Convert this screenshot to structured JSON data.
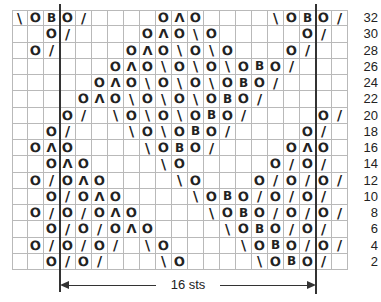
{
  "chart": {
    "columns": 21,
    "row_labels": [
      "32",
      "30",
      "28",
      "26",
      "24",
      "22",
      "20",
      "18",
      "16",
      "14",
      "12",
      "10",
      "8",
      "6",
      "4",
      "2"
    ],
    "symbols": {
      "\\": "ssk",
      "O": "yarn-over",
      "B": "knit-through-back-loop",
      "/": "k2tog",
      "Λ": "central-double-decrease"
    },
    "rows": [
      {
        "label": "32",
        "cells": {
          "0": "\\",
          "1": "O",
          "2": "B",
          "3": "O",
          "4": "/",
          "9": "O",
          "10": "Λ",
          "11": "O",
          "16": "\\",
          "17": "O",
          "18": "B",
          "19": "O",
          "20": "/"
        }
      },
      {
        "label": "30",
        "cells": {
          "2": "O",
          "3": "/",
          "8": "O",
          "9": "Λ",
          "10": "O",
          "11": "\\",
          "12": "O",
          "18": "O",
          "19": "/"
        }
      },
      {
        "label": "28",
        "cells": {
          "1": "O",
          "2": "/",
          "7": "O",
          "8": "Λ",
          "9": "O",
          "10": "\\",
          "11": "O",
          "12": "\\",
          "13": "O",
          "17": "O",
          "18": "/"
        }
      },
      {
        "label": "26",
        "cells": {
          "6": "O",
          "7": "Λ",
          "8": "O",
          "9": "\\",
          "10": "O",
          "11": "\\",
          "12": "O",
          "13": "\\",
          "14": "O",
          "15": "B",
          "16": "O",
          "17": "/"
        }
      },
      {
        "label": "24",
        "cells": {
          "5": "O",
          "6": "Λ",
          "7": "O",
          "8": "\\",
          "9": "O",
          "10": "\\",
          "11": "O",
          "12": "\\",
          "13": "O",
          "14": "B",
          "15": "O",
          "16": "/"
        }
      },
      {
        "label": "22",
        "cells": {
          "4": "O",
          "5": "Λ",
          "6": "O",
          "7": "\\",
          "8": "O",
          "9": "\\",
          "10": "O",
          "11": "\\",
          "12": "O",
          "13": "B",
          "14": "O",
          "15": "/"
        }
      },
      {
        "label": "20",
        "cells": {
          "3": "O",
          "4": "/",
          "6": "\\",
          "7": "O",
          "8": "\\",
          "9": "O",
          "10": "\\",
          "11": "O",
          "12": "B",
          "13": "O",
          "14": "/",
          "19": "O",
          "20": "/"
        }
      },
      {
        "label": "18",
        "cells": {
          "2": "O",
          "3": "/",
          "7": "\\",
          "8": "O",
          "9": "\\",
          "10": "O",
          "11": "B",
          "12": "O",
          "13": "/",
          "18": "O",
          "19": "/"
        }
      },
      {
        "label": "16",
        "cells": {
          "1": "O",
          "2": "Λ",
          "3": "O",
          "8": "\\",
          "9": "O",
          "10": "B",
          "11": "O",
          "12": "/",
          "17": "O",
          "18": "Λ",
          "19": "O"
        }
      },
      {
        "label": "14",
        "cells": {
          "2": "O",
          "3": "Λ",
          "4": "O",
          "9": "\\",
          "10": "O",
          "16": "O",
          "17": "/",
          "18": "O",
          "19": "/"
        }
      },
      {
        "label": "12",
        "cells": {
          "1": "O",
          "2": "/",
          "3": "O",
          "4": "Λ",
          "5": "O",
          "10": "\\",
          "11": "O",
          "15": "O",
          "16": "/",
          "17": "O",
          "18": "/",
          "19": "O",
          "20": "/"
        }
      },
      {
        "label": "10",
        "cells": {
          "2": "O",
          "3": "/",
          "4": "O",
          "5": "Λ",
          "6": "O",
          "11": "\\",
          "12": "O",
          "13": "B",
          "14": "O",
          "15": "/",
          "16": "O",
          "17": "/",
          "18": "O",
          "19": "/"
        }
      },
      {
        "label": "8",
        "cells": {
          "1": "O",
          "2": "/",
          "3": "O",
          "4": "/",
          "5": "O",
          "6": "Λ",
          "7": "O",
          "12": "\\",
          "13": "O",
          "14": "B",
          "15": "O",
          "16": "/",
          "17": "O",
          "18": "/",
          "19": "O",
          "20": "/"
        }
      },
      {
        "label": "6",
        "cells": {
          "2": "O",
          "3": "/",
          "4": "O",
          "5": "/",
          "6": "O",
          "7": "Λ",
          "8": "O",
          "13": "\\",
          "14": "O",
          "15": "B",
          "16": "O",
          "17": "/",
          "18": "O",
          "19": "/"
        }
      },
      {
        "label": "4",
        "cells": {
          "1": "O",
          "2": "/",
          "3": "O",
          "4": "/",
          "5": "O",
          "6": "/",
          "8": "\\",
          "9": "O",
          "14": "\\",
          "15": "O",
          "16": "B",
          "17": "O",
          "18": "/",
          "19": "O",
          "20": "/"
        }
      },
      {
        "label": "2",
        "cells": {
          "2": "O",
          "3": "/",
          "4": "O",
          "5": "/",
          "9": "\\",
          "10": "O",
          "15": "\\",
          "16": "O",
          "17": "B",
          "18": "O",
          "19": "/"
        }
      }
    ],
    "repeat": {
      "label": "16 sts",
      "start_col": 3,
      "end_col": 19
    },
    "colors": {
      "grid": "#b9b9b9",
      "ink": "#222222",
      "repeat_line": "#333333"
    }
  }
}
